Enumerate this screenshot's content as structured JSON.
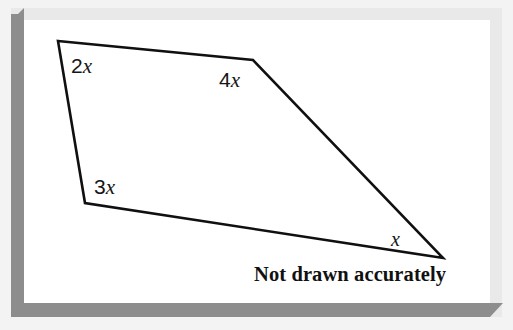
{
  "canvas": {
    "width": 513,
    "height": 330,
    "background_color": "#f3f3f3"
  },
  "frame": {
    "bevel_color": "#8d8d8d",
    "card_color": "#ffffff",
    "tint_color": "#e9e9e9"
  },
  "figure": {
    "type": "quadrilateral",
    "stroke_color": "#101010",
    "stroke_width": 2.6,
    "fill": "none",
    "vertices": [
      {
        "id": "top-left",
        "x": 58,
        "y": 41,
        "angle_label": "2x"
      },
      {
        "id": "top-right",
        "x": 253,
        "y": 60,
        "angle_label": "4x"
      },
      {
        "id": "right",
        "x": 443,
        "y": 258,
        "angle_label": "x"
      },
      {
        "id": "bottom-left",
        "x": 85,
        "y": 203,
        "angle_label": "3x"
      }
    ],
    "points_attr": "58,41 253,60 443,258 85,203"
  },
  "labels": {
    "angle_top_left": {
      "coefficient": "2",
      "variable": "x"
    },
    "angle_top_right": {
      "coefficient": "4",
      "variable": "x"
    },
    "angle_bottom_left": {
      "coefficient": "3",
      "variable": "x"
    },
    "angle_right": {
      "coefficient": "",
      "variable": "x"
    }
  },
  "caption": {
    "text": "Not drawn accurately"
  }
}
